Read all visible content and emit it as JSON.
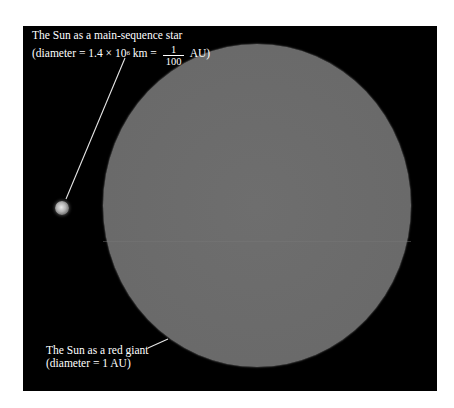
{
  "figure": {
    "background_color": "#000000",
    "page_color": "#ffffff"
  },
  "main_sequence_star": {
    "label_line1": "The Sun as a main-sequence star",
    "diameter_prefix": "(diameter = 1.4 × 10",
    "diameter_exponent": "6",
    "diameter_unit": " km = ",
    "fraction_numerator": "1",
    "fraction_denominator": "100",
    "fraction_suffix": " AU)",
    "color": "#d8d8d8"
  },
  "red_giant": {
    "label_line1": "The Sun as a red giant",
    "label_line2": "(diameter = 1 AU)",
    "color": "#6a6a6a"
  }
}
